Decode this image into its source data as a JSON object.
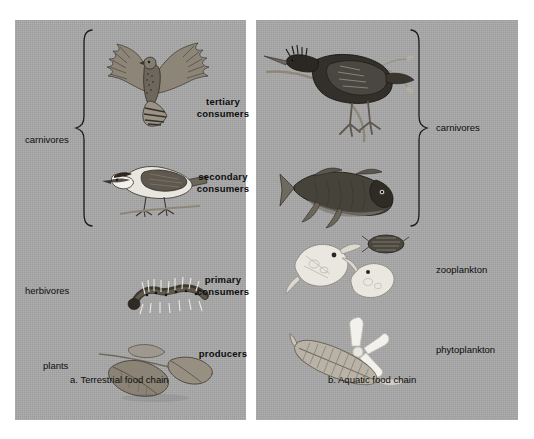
{
  "figure": {
    "background_color": "#ffffff",
    "panel_color": "#a8a8a8"
  },
  "panels": [
    {
      "id": "terrestrial",
      "caption": "a. Terrestrial food chain",
      "left_labels": [
        {
          "text": "carnivores",
          "has_brace": true
        },
        {
          "text": "herbivores",
          "has_brace": false
        },
        {
          "text": "plants",
          "has_brace": false
        }
      ],
      "organisms": [
        {
          "name": "hawk",
          "trophic": "tertiary consumers"
        },
        {
          "name": "warbler",
          "trophic": "secondary consumers"
        },
        {
          "name": "caterpillar",
          "trophic": "primary consumers"
        },
        {
          "name": "leaves",
          "trophic": "producers"
        }
      ]
    },
    {
      "id": "aquatic",
      "caption": "b. Aquatic food chain",
      "right_labels": [
        {
          "text": "carnivores",
          "has_brace": true
        },
        {
          "text": "zooplankton",
          "has_brace": false
        },
        {
          "text": "phytoplankton",
          "has_brace": false
        }
      ],
      "organisms": [
        {
          "name": "heron",
          "trophic": "tertiary consumers"
        },
        {
          "name": "fish",
          "trophic": "secondary consumers"
        },
        {
          "name": "zooplankton",
          "trophic": "primary consumers"
        },
        {
          "name": "phytoplankton-diatoms",
          "trophic": "producers"
        }
      ]
    }
  ],
  "trophic_levels": [
    {
      "line1": "tertiary",
      "line2": "consumers"
    },
    {
      "line1": "secondary",
      "line2": "consumers"
    },
    {
      "line1": "primary",
      "line2": "consumers"
    },
    {
      "line1": "producers",
      "line2": ""
    }
  ]
}
